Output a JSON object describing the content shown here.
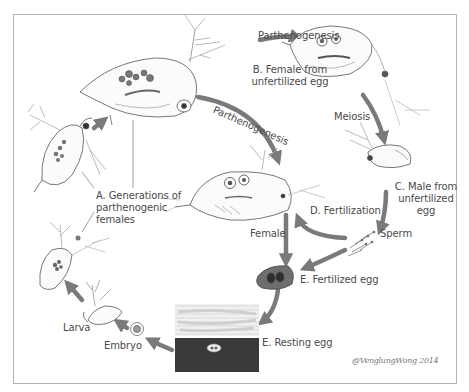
{
  "diagram": {
    "colors": {
      "arrow": "#7a7a7a",
      "frame_border": "#b4b4b4",
      "background": "#ffffff",
      "label_text": "#4a4a4a",
      "sediment_dark": "#3a3a3a",
      "egg_fill": "#6e6e6e"
    },
    "labels": {
      "parthenogenesis_top": "Parthenogenesis",
      "parthenogenesis_curve": "Parthenogenesis",
      "stage_b_line1": "B. Female from",
      "stage_b_line2": "unfertilized egg",
      "meiosis": "Meiosis",
      "stage_a_line1": "A. Generations of",
      "stage_a_line2": "parthenogenic",
      "stage_a_line3": "females",
      "stage_c_line1": "C. Male from",
      "stage_c_line2": "unfertilized",
      "stage_c_line3": "egg",
      "stage_d": "D. Fertilization",
      "sperm": "Sperm",
      "female": "Female",
      "stage_e_fertilized": "E. Fertilized egg",
      "stage_e_resting": "E. Resting egg",
      "larva": "Larva",
      "embryo": "Embryo"
    },
    "signature": "@VenglungWong 2014"
  }
}
